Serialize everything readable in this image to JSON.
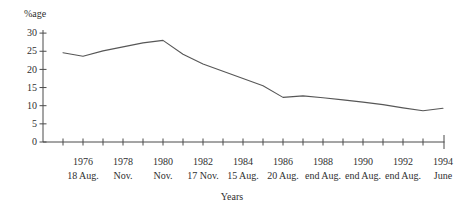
{
  "chart_data": {
    "type": "line",
    "title": "",
    "ylabel": "%age",
    "xlabel": "Years",
    "x": [
      1975,
      1976,
      1977,
      1978,
      1979,
      1980,
      1981,
      1982,
      1983,
      1984,
      1985,
      1986,
      1987,
      1988,
      1989,
      1990,
      1991,
      1992,
      1993,
      1994
    ],
    "values": [
      24.6,
      23.6,
      25.1,
      26.2,
      27.3,
      28,
      24.2,
      21.5,
      19.5,
      17.5,
      15.5,
      12.3,
      12.7,
      12.2,
      11.6,
      11.0,
      10.3,
      9.4,
      8.6,
      9.3
    ],
    "ylim": [
      0,
      30
    ],
    "y_ticks": [
      0,
      5,
      10,
      15,
      20,
      25,
      30
    ],
    "grid": false,
    "legend": null,
    "x_major_tick_labels": [
      {
        "year": "1976",
        "date": "18 Aug."
      },
      {
        "year": "1978",
        "date": "Nov."
      },
      {
        "year": "1980",
        "date": "Nov."
      },
      {
        "year": "1982",
        "date": "17 Nov."
      },
      {
        "year": "1984",
        "date": "15 Aug."
      },
      {
        "year": "1986",
        "date": "20 Aug."
      },
      {
        "year": "1988",
        "date": "end Aug."
      },
      {
        "year": "1990",
        "date": "end Aug."
      },
      {
        "year": "1992",
        "date": "end Aug."
      },
      {
        "year": "1994",
        "date": "June"
      }
    ],
    "line_color": "#575757",
    "axis_color": "#4a4a4a",
    "text_color": "#2f2f2f"
  }
}
